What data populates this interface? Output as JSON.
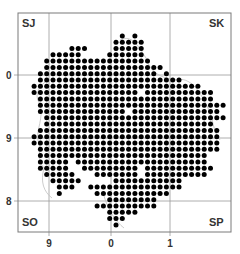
{
  "map": {
    "type": "distribution-dot-map",
    "frame": {
      "x": 18,
      "y": 13,
      "width": 213,
      "height": 219
    },
    "grid_color": "#9a9a9a",
    "frame_color": "#7a7a7a",
    "boundary_color": "#b8b8b8",
    "dot_color": "#000000",
    "corner_labels": {
      "top_left": "SJ",
      "top_right": "SK",
      "bottom_left": "SO",
      "bottom_right": "SP"
    },
    "y_axis_labels": [
      {
        "text": "0",
        "y": 75
      },
      {
        "text": "9",
        "y": 138
      },
      {
        "text": "8",
        "y": 201
      }
    ],
    "x_axis_labels": [
      {
        "text": "9",
        "x": 49
      },
      {
        "text": "0",
        "x": 111
      },
      {
        "text": "1",
        "x": 170
      }
    ],
    "dot_origin": {
      "x": 21.5,
      "y": 17
    },
    "dot_pitch": 6.3,
    "dot_radius": 2.5,
    "rows": [
      "..................................",
      "..................................",
      "...............................",
      "................1.1...............",
      "...............11111..............",
      "........111....11111..............",
      ".....11111....111111..............",
      "....11111111111111111.............",
      "....1111111111111111111...........",
      "...1111111111111111111.1..........",
      "...11111111111111111111111........",
      "..111111111111111111111111111.....",
      "..11111111111111111.11111111111...",
      "...1111111111111111111111111111...",
      "...111111111111111111111111111111.",
      "...11111111111111.11111111111111..",
      "....111111111111111111111111111111",
      "....111111111111111111111111111...",
      "...11111111111111111111111111111..",
      "..111111111111111111111111111111..",
      "..111111111111111111111111111111..",
      "...11111111111111111111111111111..",
      "...111111111111111111111111111....",
      "...11111.111111111111111111111....",
      "...11111..111111111.11111111111...",
      "....11111...1111111.1111111111....",
      ".....11111.....11111111111........",
      "......111..111111111111111........",
      "......1.....111111111111..........",
      "..............11111111............",
      "............1111111111............",
      "..............11111...............",
      "..............111.................",
      "...............1.................."
    ]
  }
}
